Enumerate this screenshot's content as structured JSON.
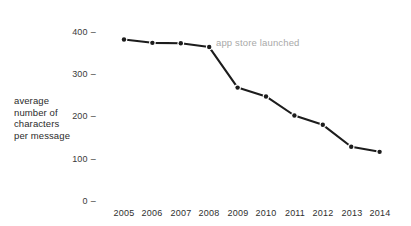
{
  "chart_data": {
    "type": "line",
    "title": "",
    "subtitle": "",
    "xlabel": "",
    "ylabel": "average\nnumber of\ncharacters\nper message",
    "categories": [
      "2005",
      "2006",
      "2007",
      "2008",
      "2009",
      "2010",
      "2011",
      "2012",
      "2013",
      "2014"
    ],
    "x": [
      2005,
      2006,
      2007,
      2008,
      2009,
      2010,
      2011,
      2012,
      2013,
      2014
    ],
    "values": [
      380,
      372,
      371,
      362,
      266,
      245,
      200,
      178,
      126,
      114
    ],
    "series": [
      {
        "name": "average characters per message",
        "values": [
          380,
          372,
          371,
          362,
          266,
          245,
          200,
          178,
          126,
          114
        ]
      }
    ],
    "ylim": [
      0,
      400
    ],
    "yticks": [
      0,
      100,
      200,
      300,
      400
    ],
    "ytick_labels": [
      "0",
      "100",
      "200",
      "300",
      "400"
    ],
    "xlim": [
      2004.4,
      2014.6
    ],
    "grid": false,
    "legend": null,
    "marker": "circle",
    "line_color": "#1c1c1c",
    "marker_color": "#1c1c1c",
    "annotations": [
      {
        "text": "app store launched",
        "x": 2008,
        "y": 362,
        "color": "#a9a9a9"
      }
    ]
  },
  "axis": {
    "y_tick_dash": "–",
    "x_origin_dash": "–"
  },
  "colors": {
    "background": "#ffffff",
    "ink": "#1c1c1c",
    "tick_text": "#3a3a3a",
    "annotation": "#a9a9a9"
  }
}
